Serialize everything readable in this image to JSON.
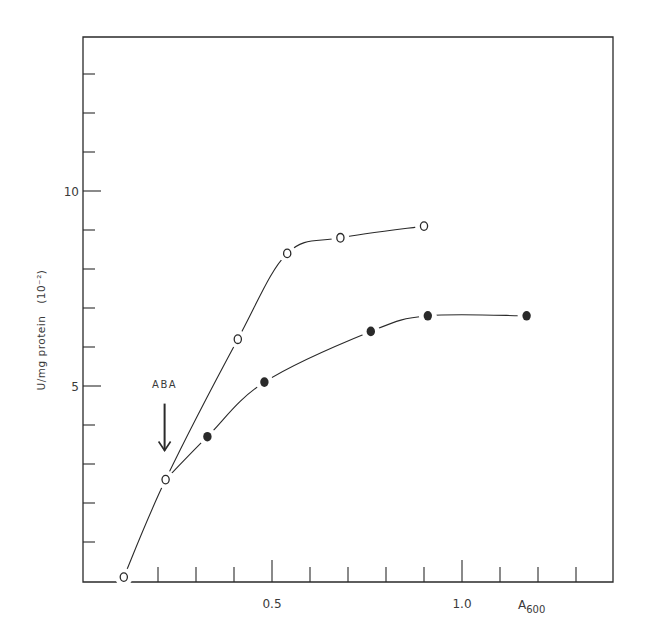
{
  "chart_data": {
    "type": "line",
    "title": "",
    "xlabel": "A",
    "xlabel_subscript": "600",
    "ylabel": "U/mg protein",
    "ylabel_unit": "(10⁻²)",
    "xlim": [
      0,
      1.4
    ],
    "ylim": [
      0,
      14
    ],
    "x_ticks": [
      0.2,
      0.3,
      0.4,
      0.5,
      0.6,
      0.7,
      0.8,
      0.9,
      1.0,
      1.1,
      1.2,
      1.3
    ],
    "x_tick_labels": [
      {
        "value": 0.5,
        "label": "0.5"
      },
      {
        "value": 1.0,
        "label": "1.0"
      }
    ],
    "y_ticks": [
      1,
      2,
      3,
      4,
      5,
      6,
      7,
      8,
      9,
      10,
      11,
      12,
      13
    ],
    "y_tick_labels": [
      {
        "value": 5,
        "label": "5"
      },
      {
        "value": 10,
        "label": "10"
      }
    ],
    "grid": false,
    "legend": null,
    "series": [
      {
        "name": "control (open circles)",
        "marker": "open-circle",
        "points": [
          {
            "x": 0.11,
            "y": 0.1
          },
          {
            "x": 0.22,
            "y": 2.6
          },
          {
            "x": 0.41,
            "y": 6.2
          },
          {
            "x": 0.54,
            "y": 8.4
          },
          {
            "x": 0.68,
            "y": 8.8
          },
          {
            "x": 0.9,
            "y": 9.1
          }
        ]
      },
      {
        "name": "+ABA (filled circles)",
        "marker": "filled-circle",
        "points": [
          {
            "x": 0.22,
            "y": 2.6
          },
          {
            "x": 0.33,
            "y": 3.7
          },
          {
            "x": 0.48,
            "y": 5.1
          },
          {
            "x": 0.76,
            "y": 6.4
          },
          {
            "x": 0.91,
            "y": 6.8
          },
          {
            "x": 1.17,
            "y": 6.8
          }
        ]
      }
    ],
    "annotations": [
      {
        "text": "ABA",
        "type": "arrow-down",
        "x": 0.22,
        "y_from": 4.6,
        "y_to": 3.5
      }
    ]
  },
  "colors": {
    "ink": "#2a2a2a",
    "background": "#ffffff"
  }
}
